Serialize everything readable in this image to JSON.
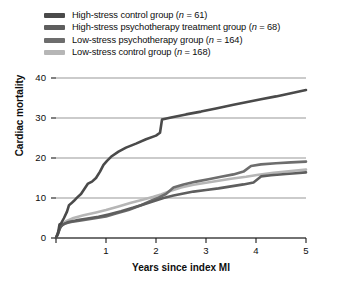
{
  "chart_data": {
    "type": "line",
    "title": "",
    "xlabel": "Years since index MI",
    "ylabel": "Cardiac mortality",
    "xlim": [
      0,
      5
    ],
    "ylim": [
      0,
      40
    ],
    "xticks": [
      "0",
      "1",
      "2",
      "3",
      "4",
      "5"
    ],
    "yticks": [
      "0",
      "10",
      "20",
      "30",
      "40"
    ],
    "grid": true,
    "legend_position": "top-left-outside",
    "series": [
      {
        "name": "High-stress control group",
        "n": 61,
        "legend_label": "High-stress control group (n = 61)",
        "color": "#4a4a4a",
        "points": [
          [
            0.0,
            0.0
          ],
          [
            0.04,
            1.2
          ],
          [
            0.07,
            3.4
          ],
          [
            0.1,
            3.6
          ],
          [
            0.16,
            5.0
          ],
          [
            0.22,
            6.6
          ],
          [
            0.26,
            8.2
          ],
          [
            0.3,
            8.6
          ],
          [
            0.36,
            9.3
          ],
          [
            0.42,
            10.1
          ],
          [
            0.5,
            11.0
          ],
          [
            0.58,
            12.5
          ],
          [
            0.64,
            13.6
          ],
          [
            0.72,
            14.1
          ],
          [
            0.8,
            15.0
          ],
          [
            0.88,
            16.6
          ],
          [
            0.95,
            18.3
          ],
          [
            1.02,
            19.3
          ],
          [
            1.1,
            20.3
          ],
          [
            1.25,
            21.6
          ],
          [
            1.4,
            22.6
          ],
          [
            1.6,
            23.6
          ],
          [
            1.8,
            24.7
          ],
          [
            2.0,
            25.6
          ],
          [
            2.08,
            26.3
          ],
          [
            2.12,
            29.6
          ],
          [
            2.3,
            30.1
          ],
          [
            2.6,
            30.9
          ],
          [
            2.9,
            31.6
          ],
          [
            3.2,
            32.4
          ],
          [
            3.55,
            33.3
          ],
          [
            3.9,
            34.2
          ],
          [
            4.1,
            34.7
          ],
          [
            4.4,
            35.4
          ],
          [
            4.7,
            36.2
          ],
          [
            5.0,
            37.0
          ]
        ]
      },
      {
        "name": "High-stress psychotherapy treatment group",
        "n": 68,
        "legend_label": "High-stress psychotherapy treatment group (n = 68)",
        "color": "#5e5e5e",
        "points": [
          [
            0.0,
            0.0
          ],
          [
            0.04,
            1.0
          ],
          [
            0.08,
            2.6
          ],
          [
            0.14,
            3.4
          ],
          [
            0.25,
            4.0
          ],
          [
            0.4,
            4.4
          ],
          [
            0.6,
            4.8
          ],
          [
            0.85,
            5.3
          ],
          [
            1.05,
            5.9
          ],
          [
            1.3,
            6.7
          ],
          [
            1.55,
            7.6
          ],
          [
            1.75,
            8.4
          ],
          [
            1.95,
            9.2
          ],
          [
            2.15,
            10.0
          ],
          [
            2.35,
            10.6
          ],
          [
            2.55,
            11.1
          ],
          [
            2.75,
            11.6
          ],
          [
            3.0,
            12.0
          ],
          [
            3.25,
            12.4
          ],
          [
            3.5,
            12.9
          ],
          [
            3.75,
            13.4
          ],
          [
            3.95,
            13.9
          ],
          [
            4.1,
            15.4
          ],
          [
            4.3,
            15.7
          ],
          [
            4.6,
            16.0
          ],
          [
            4.8,
            16.2
          ],
          [
            5.0,
            16.4
          ]
        ]
      },
      {
        "name": "Low-stress psychotherapy group",
        "n": 164,
        "legend_label": "Low-stress psychotherapy group (n = 164)",
        "color": "#6d6d6d",
        "points": [
          [
            0.0,
            0.0
          ],
          [
            0.05,
            1.6
          ],
          [
            0.1,
            3.0
          ],
          [
            0.18,
            3.6
          ],
          [
            0.3,
            4.0
          ],
          [
            0.5,
            4.4
          ],
          [
            0.75,
            4.9
          ],
          [
            1.0,
            5.4
          ],
          [
            1.2,
            6.1
          ],
          [
            1.45,
            7.0
          ],
          [
            1.7,
            8.2
          ],
          [
            1.9,
            9.3
          ],
          [
            2.05,
            10.1
          ],
          [
            2.2,
            11.0
          ],
          [
            2.35,
            12.6
          ],
          [
            2.55,
            13.4
          ],
          [
            2.8,
            14.1
          ],
          [
            3.05,
            14.7
          ],
          [
            3.3,
            15.3
          ],
          [
            3.55,
            15.9
          ],
          [
            3.75,
            16.6
          ],
          [
            3.9,
            18.0
          ],
          [
            4.1,
            18.4
          ],
          [
            4.4,
            18.7
          ],
          [
            4.7,
            18.9
          ],
          [
            5.0,
            19.1
          ]
        ]
      },
      {
        "name": "Low-stress control group",
        "n": 168,
        "legend_label": "Low-stress control group (n = 168)",
        "color": "#b6b6b6",
        "points": [
          [
            0.0,
            0.0
          ],
          [
            0.05,
            1.8
          ],
          [
            0.12,
            3.4
          ],
          [
            0.2,
            4.2
          ],
          [
            0.35,
            5.0
          ],
          [
            0.55,
            5.7
          ],
          [
            0.8,
            6.4
          ],
          [
            1.0,
            7.0
          ],
          [
            1.25,
            7.9
          ],
          [
            1.5,
            8.8
          ],
          [
            1.75,
            9.6
          ],
          [
            1.95,
            10.3
          ],
          [
            2.1,
            10.9
          ],
          [
            2.3,
            11.8
          ],
          [
            2.5,
            12.6
          ],
          [
            2.75,
            13.3
          ],
          [
            3.0,
            13.8
          ],
          [
            3.25,
            14.3
          ],
          [
            3.5,
            14.8
          ],
          [
            3.8,
            15.3
          ],
          [
            4.05,
            15.8
          ],
          [
            4.35,
            16.3
          ],
          [
            4.65,
            16.7
          ],
          [
            5.0,
            17.1
          ]
        ]
      }
    ]
  }
}
